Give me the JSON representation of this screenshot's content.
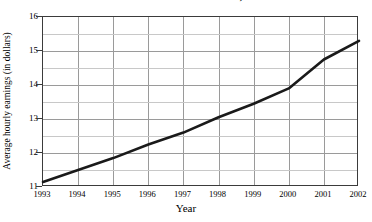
{
  "chart_data": {
    "type": "line",
    "title": "in Educational and Health Services, 1993–2002",
    "xlabel": "Year",
    "ylabel": "Average hourly earnings (in dollars)",
    "grid": true,
    "legend": "none",
    "categories": [
      "1993",
      "1994",
      "1995",
      "1996",
      "1997",
      "1998",
      "1999",
      "2000",
      "2001",
      "2002"
    ],
    "x": [
      1993,
      1994,
      1995,
      1996,
      1997,
      1998,
      1999,
      2000,
      2001,
      2002
    ],
    "values": [
      11.15,
      11.5,
      11.85,
      12.25,
      12.6,
      13.05,
      13.45,
      13.9,
      14.75,
      15.3
    ],
    "xlim": [
      1993,
      2002
    ],
    "ylim": [
      11,
      16
    ],
    "ytick_labels": [
      "11",
      "12",
      "13",
      "14",
      "15",
      "16"
    ],
    "ytick_values": [
      11,
      12,
      13,
      14,
      15,
      16
    ],
    "yminor_values": [
      11.5,
      12.5,
      13.5,
      14.5,
      15.5
    ],
    "series_color": "#1a1a1a",
    "grid_color": "#9a9a9a",
    "axis_color": "#3b3b3b"
  }
}
